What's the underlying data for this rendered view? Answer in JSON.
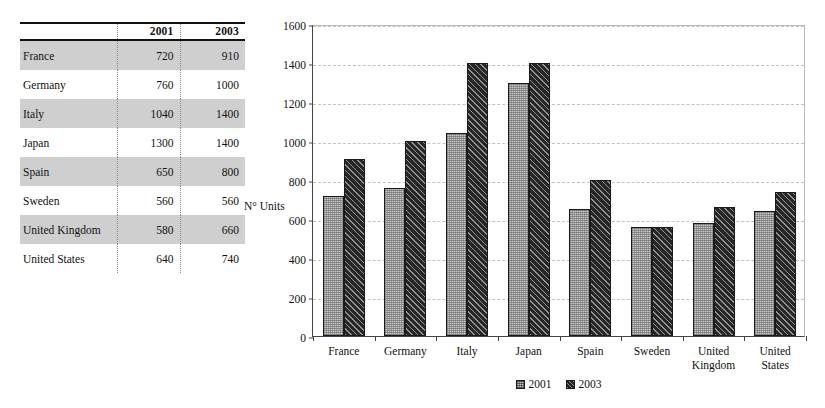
{
  "table": {
    "columns": [
      "",
      "2001",
      "2003"
    ],
    "rows": [
      {
        "country": "France",
        "y2001": "720",
        "y2003": "910",
        "shaded": true
      },
      {
        "country": "Germany",
        "y2001": "760",
        "y2003": "1000",
        "shaded": false
      },
      {
        "country": "Italy",
        "y2001": "1040",
        "y2003": "1400",
        "shaded": true
      },
      {
        "country": "Japan",
        "y2001": "1300",
        "y2003": "1400",
        "shaded": false
      },
      {
        "country": "Spain",
        "y2001": "650",
        "y2003": "800",
        "shaded": true
      },
      {
        "country": "Sweden",
        "y2001": "560",
        "y2003": "560",
        "shaded": false
      },
      {
        "country": "United Kingdom",
        "y2001": "580",
        "y2003": "660",
        "shaded": true
      },
      {
        "country": "United States",
        "y2001": "640",
        "y2003": "740",
        "shaded": false
      }
    ]
  },
  "chart_data": {
    "type": "bar",
    "title": "",
    "xlabel": "",
    "ylabel": "N° Units",
    "ylim": [
      0,
      1600
    ],
    "yticks": [
      0,
      200,
      400,
      600,
      800,
      1000,
      1200,
      1400,
      1600
    ],
    "ytick_labels": [
      "0",
      "200",
      "400",
      "600",
      "800",
      "1000",
      "1200",
      "1400",
      "1600"
    ],
    "grid": true,
    "legend_position": "bottom-center",
    "categories": [
      "France",
      "Germany",
      "Italy",
      "Japan",
      "Spain",
      "Sweden",
      "United\nKingdom",
      "United\nStates"
    ],
    "series": [
      {
        "name": "2001",
        "values": [
          720,
          760,
          1040,
          1300,
          650,
          560,
          580,
          640
        ],
        "color": "#c9c9c9",
        "pattern": "dotted-stipple"
      },
      {
        "name": "2003",
        "values": [
          910,
          1000,
          1400,
          1400,
          800,
          560,
          660,
          740
        ],
        "color": "#262626",
        "pattern": "diagonal-hatch"
      }
    ]
  }
}
